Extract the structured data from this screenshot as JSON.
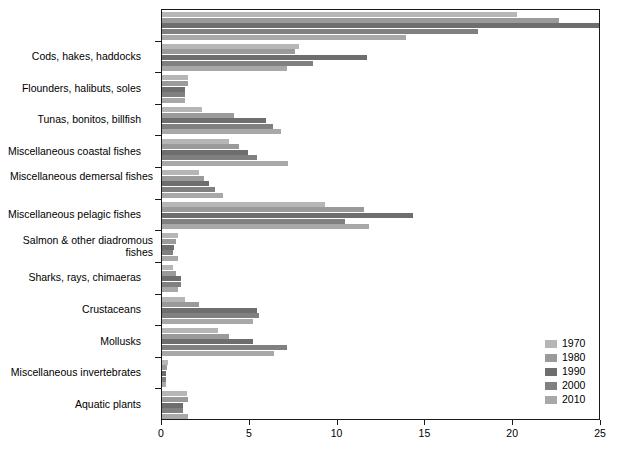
{
  "chart_data": {
    "type": "bar",
    "orientation": "horizontal",
    "title": "",
    "xlabel": "",
    "ylabel": "",
    "xlim": [
      0,
      25
    ],
    "xticks": [
      0,
      5,
      10,
      15,
      20,
      25
    ],
    "xtick_labels": [
      "0",
      "5",
      "10",
      "15",
      "20",
      "25"
    ],
    "grid": false,
    "legend_position": "lower-right",
    "categories": [
      "",
      "Cods, hakes, haddocks",
      "Flounders, halibuts, soles",
      "Tunas, bonitos, billfish",
      "Miscellaneous coastal fishes",
      "Miscellaneous demersal fishes",
      "Miscellaneous pelagic fishes",
      "Salmon & other diadromous fishes",
      "Sharks, rays, chimaeras",
      "Crustaceans",
      "Mollusks",
      "Miscellaneous invertebrates",
      "Aquatic plants"
    ],
    "series": [
      {
        "name": "1970",
        "color": "#b6b6b6",
        "values": [
          20.2,
          7.8,
          1.5,
          2.3,
          3.8,
          2.1,
          9.3,
          0.9,
          0.6,
          1.3,
          3.2,
          0.35,
          1.4
        ]
      },
      {
        "name": "1980",
        "color": "#9a9a9a",
        "values": [
          22.6,
          7.6,
          1.5,
          4.1,
          4.4,
          2.4,
          11.5,
          0.8,
          0.8,
          2.1,
          3.8,
          0.3,
          1.5
        ]
      },
      {
        "name": "1990",
        "color": "#6e6e6e",
        "values": [
          25.0,
          11.7,
          1.3,
          5.9,
          4.9,
          2.7,
          14.3,
          0.7,
          1.1,
          5.4,
          5.2,
          0.25,
          1.2
        ]
      },
      {
        "name": "2000",
        "color": "#808080",
        "values": [
          18.0,
          8.6,
          1.3,
          6.3,
          5.4,
          3.0,
          10.4,
          0.6,
          1.1,
          5.5,
          7.1,
          0.2,
          1.2
        ]
      },
      {
        "name": "2010",
        "color": "#a8a8a8",
        "values": [
          13.9,
          7.1,
          1.3,
          6.8,
          7.2,
          3.5,
          11.8,
          0.9,
          0.9,
          5.2,
          6.4,
          0.2,
          1.5
        ]
      }
    ]
  },
  "legend": {
    "entries": [
      {
        "label": "1970",
        "color": "#b6b6b6"
      },
      {
        "label": "1980",
        "color": "#9a9a9a"
      },
      {
        "label": "1990",
        "color": "#6e6e6e"
      },
      {
        "label": "2000",
        "color": "#808080"
      },
      {
        "label": "2010",
        "color": "#a8a8a8"
      }
    ]
  },
  "axes": {
    "x_tick_labels": [
      "0",
      "5",
      "10",
      "15",
      "20",
      "25"
    ],
    "y_tick_labels": [
      "Cods, hakes, haddocks",
      "Flounders, halibuts, soles",
      "Tunas, bonitos, billfish",
      "Miscellaneous coastal fishes",
      "Miscellaneous demersal fishes",
      "Miscellaneous pelagic fishes",
      "Salmon & other diadromous fishes",
      "Sharks, rays, chimaeras",
      "Crustaceans",
      "Mollusks",
      "Miscellaneous invertebrates",
      "Aquatic plants"
    ]
  },
  "colors": {
    "axis": "#1a1a1a",
    "background": "#ffffff",
    "text": "#000000"
  }
}
